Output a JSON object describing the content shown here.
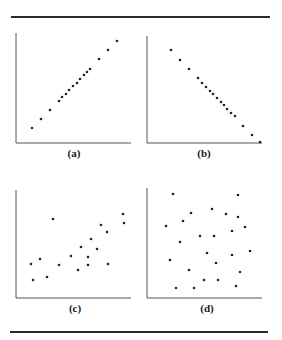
{
  "figure": {
    "rule_color": "#2a2a2a",
    "axis_color": "#555555",
    "point_color": "#222222"
  },
  "chart_data": [
    {
      "type": "scatter",
      "label": "(a)",
      "title": "",
      "xlabel": "",
      "ylabel": "",
      "grid": false,
      "description": "strong positive linear relationship",
      "axes_px": {
        "x0": 16,
        "y0": 143,
        "x1": 131,
        "y1": 33
      },
      "points": [
        [
          32,
          128
        ],
        [
          41,
          119
        ],
        [
          50,
          110
        ],
        [
          59,
          101
        ],
        [
          62,
          97
        ],
        [
          66,
          94
        ],
        [
          69,
          90
        ],
        [
          73,
          86
        ],
        [
          77,
          83
        ],
        [
          80,
          79
        ],
        [
          84,
          75
        ],
        [
          87,
          72
        ],
        [
          90,
          69
        ],
        [
          99,
          59
        ],
        [
          108,
          50
        ],
        [
          117,
          41
        ]
      ]
    },
    {
      "type": "scatter",
      "label": "(b)",
      "title": "",
      "xlabel": "",
      "ylabel": "",
      "grid": false,
      "description": "strong negative linear relationship",
      "axes_px": {
        "x0": 147,
        "y0": 143,
        "x1": 262,
        "y1": 36
      },
      "points": [
        [
          171,
          50
        ],
        [
          180,
          60
        ],
        [
          189,
          69
        ],
        [
          198,
          78
        ],
        [
          202,
          83
        ],
        [
          206,
          87
        ],
        [
          210,
          91
        ],
        [
          213,
          94
        ],
        [
          217,
          98
        ],
        [
          221,
          102
        ],
        [
          224,
          105
        ],
        [
          227,
          109
        ],
        [
          231,
          113
        ],
        [
          235,
          116
        ],
        [
          243,
          126
        ],
        [
          252,
          135
        ],
        [
          260,
          142
        ]
      ]
    },
    {
      "type": "scatter",
      "label": "(c)",
      "title": "",
      "xlabel": "",
      "ylabel": "",
      "grid": false,
      "description": "weak positive relationship",
      "axes_px": {
        "x0": 16,
        "y0": 298,
        "x1": 131,
        "y1": 190
      },
      "points": [
        [
          31,
          264
        ],
        [
          40,
          259
        ],
        [
          53,
          219
        ],
        [
          33,
          280
        ],
        [
          47,
          277
        ],
        [
          59,
          265
        ],
        [
          71,
          256
        ],
        [
          78,
          270
        ],
        [
          81,
          247
        ],
        [
          88,
          257
        ],
        [
          88,
          265
        ],
        [
          91,
          239
        ],
        [
          97,
          249
        ],
        [
          101,
          225
        ],
        [
          107,
          232
        ],
        [
          108,
          264
        ],
        [
          123,
          214
        ],
        [
          124,
          223
        ]
      ]
    },
    {
      "type": "scatter",
      "label": "(d)",
      "title": "",
      "xlabel": "",
      "ylabel": "",
      "grid": false,
      "description": "no relationship",
      "axes_px": {
        "x0": 147,
        "y0": 298,
        "x1": 262,
        "y1": 188
      },
      "points": [
        [
          173,
          194
        ],
        [
          238,
          195
        ],
        [
          191,
          213
        ],
        [
          212,
          209
        ],
        [
          226,
          214
        ],
        [
          238,
          217
        ],
        [
          183,
          221
        ],
        [
          166,
          226
        ],
        [
          245,
          227
        ],
        [
          232,
          231
        ],
        [
          200,
          236
        ],
        [
          214,
          236
        ],
        [
          180,
          242
        ],
        [
          250,
          251
        ],
        [
          207,
          253
        ],
        [
          232,
          255
        ],
        [
          170,
          260
        ],
        [
          216,
          263
        ],
        [
          189,
          270
        ],
        [
          240,
          272
        ],
        [
          204,
          280
        ],
        [
          218,
          280
        ],
        [
          176,
          288
        ],
        [
          194,
          288
        ],
        [
          236,
          286
        ]
      ]
    }
  ],
  "labels": {
    "a": "(a)",
    "b": "(b)",
    "c": "(c)",
    "d": "(d)"
  }
}
